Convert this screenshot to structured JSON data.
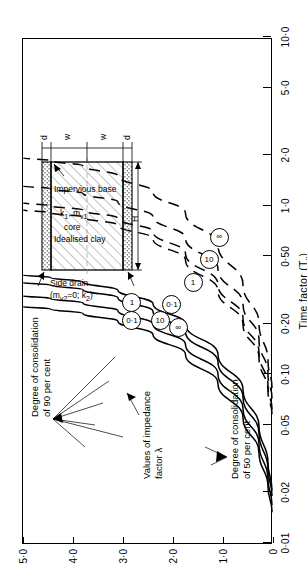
{
  "figure": {
    "x_axis": {
      "title": "Time factor (T_v)",
      "title_main": "Time factor (T",
      "title_sub": "v",
      "title_end": ")",
      "scale": "log",
      "range": [
        0.01,
        10.0
      ],
      "tick_labels": [
        "0·01",
        "0·02",
        "0·05",
        "0·10",
        "0·20",
        "0·50",
        "1·0",
        "2·0",
        "5·0",
        "10·0"
      ],
      "tick_values": [
        0.01,
        0.02,
        0.05,
        0.1,
        0.2,
        0.5,
        1.0,
        2.0,
        5.0,
        10.0
      ]
    },
    "y_axis": {
      "title": "H/2w",
      "scale": "linear",
      "range": [
        0,
        5.0
      ],
      "tick_labels": [
        "0",
        "1·0",
        "2·0",
        "3·0",
        "4·0",
        "5·0"
      ],
      "tick_values": [
        0,
        1.0,
        2.0,
        3.0,
        4.0,
        5.0
      ]
    },
    "annotations": [
      {
        "name": "u90-label",
        "lines": [
          "Degree of consolidation",
          "of 90 per cent"
        ]
      },
      {
        "name": "u50-label",
        "lines": [
          "Degree of consolidation",
          "of 50 per cent"
        ]
      },
      {
        "name": "lambda-label",
        "lines": [
          "Values of impedance",
          "factor λ"
        ]
      }
    ],
    "curve_labels": [
      "0·1",
      "1",
      "10",
      "∞"
    ],
    "inset": {
      "side_drain": [
        "Side drain",
        "(m",
        "v2",
        "=0; k",
        "2",
        ")"
      ],
      "side_drain_plain": "Side drain (mv2=0; k2)",
      "core_line1": "Idealised clay",
      "core_line2": "core",
      "core_line3_a": "k",
      "core_line3_sub": "1",
      "core_line3_b": ", m",
      "core_line3_sub2": "v1",
      "impervious": "Impervious base",
      "dim_H": "H",
      "dim_w": "w",
      "dim_d": "d"
    }
  },
  "chart_data": {
    "type": "line",
    "title": "",
    "xlabel": "Time factor (Tv)",
    "ylabel": "H/2w",
    "xscale": "log",
    "xlim": [
      0.01,
      10.0
    ],
    "ylim": [
      0,
      5.0
    ],
    "grid": false,
    "legend": "inline circled curve labels",
    "series": [
      {
        "name": "U=90%, λ=0·1",
        "group": "90 per cent",
        "lambda": "0·1",
        "style": "dashed",
        "x": [
          0.083,
          0.12,
          0.2,
          0.34,
          0.58,
          0.9,
          1.2,
          1.5,
          1.72,
          1.85,
          1.92
        ],
        "y": [
          0.02,
          0.1,
          0.28,
          0.6,
          1.1,
          1.75,
          2.4,
          3.1,
          3.8,
          4.45,
          5.0
        ]
      },
      {
        "name": "U=90%, λ=1",
        "group": "90 per cent",
        "lambda": "1",
        "style": "dashed",
        "x": [
          0.072,
          0.1,
          0.16,
          0.26,
          0.42,
          0.64,
          0.86,
          1.05,
          1.18,
          1.26,
          1.31
        ],
        "y": [
          0.02,
          0.1,
          0.28,
          0.6,
          1.1,
          1.75,
          2.4,
          3.1,
          3.8,
          4.45,
          5.0
        ]
      },
      {
        "name": "U=90%, λ=10",
        "group": "90 per cent",
        "lambda": "10",
        "style": "dashed",
        "x": [
          0.062,
          0.085,
          0.135,
          0.215,
          0.34,
          0.52,
          0.7,
          0.84,
          0.94,
          1.0,
          1.04
        ],
        "y": [
          0.02,
          0.1,
          0.28,
          0.6,
          1.1,
          1.75,
          2.4,
          3.1,
          3.8,
          4.45,
          5.0
        ]
      },
      {
        "name": "U=90%, λ=∞",
        "group": "90 per cent",
        "lambda": "∞",
        "style": "dashed",
        "x": [
          0.058,
          0.079,
          0.125,
          0.198,
          0.312,
          0.475,
          0.635,
          0.765,
          0.855,
          0.91,
          0.945
        ],
        "y": [
          0.02,
          0.1,
          0.28,
          0.6,
          1.1,
          1.75,
          2.4,
          3.1,
          3.8,
          4.45,
          5.0
        ]
      },
      {
        "name": "U=50%, λ=0·1",
        "group": "50 per cent",
        "lambda": "0·1",
        "style": "solid",
        "x": [
          0.0205,
          0.03,
          0.049,
          0.081,
          0.131,
          0.198,
          0.262,
          0.315,
          0.352,
          0.375,
          0.388
        ],
        "y": [
          0.02,
          0.1,
          0.28,
          0.6,
          1.1,
          1.75,
          2.4,
          3.1,
          3.8,
          4.45,
          5.0
        ]
      },
      {
        "name": "U=50%, λ=1",
        "group": "50 per cent",
        "lambda": "1",
        "style": "solid",
        "x": [
          0.019,
          0.0275,
          0.0445,
          0.073,
          0.118,
          0.178,
          0.236,
          0.284,
          0.317,
          0.338,
          0.35
        ],
        "y": [
          0.02,
          0.1,
          0.28,
          0.6,
          1.1,
          1.75,
          2.4,
          3.1,
          3.8,
          4.45,
          5.0
        ]
      },
      {
        "name": "U=50%, λ=10",
        "group": "50 per cent",
        "lambda": "10",
        "style": "solid",
        "x": [
          0.0168,
          0.024,
          0.0385,
          0.0625,
          0.1,
          0.15,
          0.198,
          0.238,
          0.265,
          0.282,
          0.292
        ],
        "y": [
          0.02,
          0.1,
          0.28,
          0.6,
          1.1,
          1.75,
          2.4,
          3.1,
          3.8,
          4.45,
          5.0
        ]
      },
      {
        "name": "U=50%, λ=∞",
        "group": "50 per cent",
        "lambda": "∞",
        "style": "solid",
        "x": [
          0.0152,
          0.0215,
          0.0342,
          0.0552,
          0.088,
          0.131,
          0.172,
          0.206,
          0.229,
          0.244,
          0.252
        ],
        "y": [
          0.02,
          0.1,
          0.28,
          0.6,
          1.1,
          1.75,
          2.4,
          3.1,
          3.8,
          4.45,
          5.0
        ]
      }
    ],
    "label_markers": [
      {
        "text": "0·1",
        "group": "90 per cent",
        "x": 0.255,
        "y": 2.05
      },
      {
        "text": "1",
        "group": "90 per cent",
        "x": 0.345,
        "y": 1.62
      },
      {
        "text": "10",
        "group": "90 per cent",
        "x": 0.47,
        "y": 1.3
      },
      {
        "text": "∞",
        "group": "90 per cent",
        "x": 0.64,
        "y": 1.1
      },
      {
        "text": "0·1",
        "group": "50 per cent",
        "x": 0.205,
        "y": 2.85
      },
      {
        "text": "1",
        "group": "50 per cent",
        "x": 0.262,
        "y": 2.85
      },
      {
        "text": "10",
        "group": "50 per cent",
        "x": 0.205,
        "y": 2.28
      },
      {
        "text": "∞",
        "group": "50 per cent",
        "x": 0.186,
        "y": 1.92
      }
    ]
  }
}
